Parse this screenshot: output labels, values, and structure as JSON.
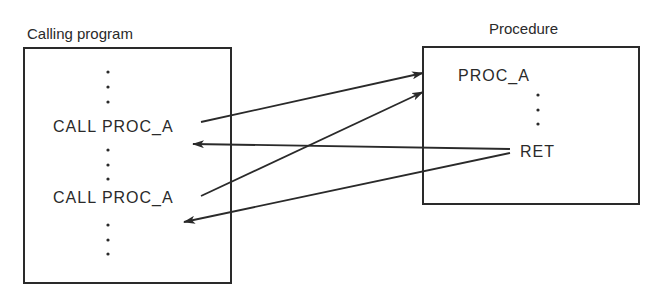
{
  "diagram": {
    "type": "procedure-call-flow",
    "calling_program": {
      "title": "Calling program",
      "lines": [
        "⋮",
        "CALL PROC_A",
        "⋮",
        "CALL PROC_A",
        "⋮"
      ],
      "call_1": "CALL PROC_A",
      "call_2": "CALL PROC_A"
    },
    "procedure": {
      "title": "Procedure",
      "entry_label": "PROC_A",
      "return_label": "RET"
    },
    "arrows": [
      {
        "from": "CALL PROC_A (1)",
        "to": "PROC_A",
        "kind": "call"
      },
      {
        "from": "CALL PROC_A (2)",
        "to": "PROC_A",
        "kind": "call"
      },
      {
        "from": "RET",
        "to": "after CALL PROC_A (1)",
        "kind": "return"
      },
      {
        "from": "RET",
        "to": "after CALL PROC_A (2)",
        "kind": "return"
      }
    ],
    "colors": {
      "ink": "#2a2a2a",
      "background": "#ffffff"
    }
  }
}
